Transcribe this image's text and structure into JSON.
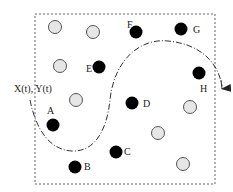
{
  "diagram": {
    "frame": {
      "x": 35,
      "y": 14,
      "width": 180,
      "height": 170
    },
    "trajectory_label": "X(t), Y(t)",
    "filled_nodes": [
      {
        "id": "A",
        "label": "A",
        "cx": 53,
        "cy": 125,
        "lx": 47,
        "ly": 106
      },
      {
        "id": "B",
        "label": "B",
        "cx": 75,
        "cy": 167,
        "lx": 84,
        "ly": 162
      },
      {
        "id": "C",
        "label": "C",
        "cx": 116,
        "cy": 152,
        "lx": 124,
        "ly": 147
      },
      {
        "id": "D",
        "label": "D",
        "cx": 132,
        "cy": 103,
        "lx": 143,
        "ly": 99
      },
      {
        "id": "E",
        "label": "E",
        "cx": 99,
        "cy": 67,
        "lx": 86,
        "ly": 64
      },
      {
        "id": "F",
        "label": "F",
        "cx": 136,
        "cy": 32,
        "lx": 127,
        "ly": 20
      },
      {
        "id": "G",
        "label": "G",
        "cx": 181,
        "cy": 29,
        "lx": 193,
        "ly": 25
      },
      {
        "id": "H",
        "label": "H",
        "cx": 199,
        "cy": 73,
        "lx": 200,
        "ly": 84
      }
    ],
    "open_nodes": [
      {
        "cx": 55,
        "cy": 27
      },
      {
        "cx": 93,
        "cy": 32
      },
      {
        "cx": 60,
        "cy": 66
      },
      {
        "cx": 76,
        "cy": 100
      },
      {
        "cx": 190,
        "cy": 107
      },
      {
        "cx": 158,
        "cy": 133
      },
      {
        "cx": 183,
        "cy": 164
      }
    ],
    "colors": {
      "filled": "#000000",
      "open_fill": "#e6e6e6",
      "open_stroke": "#555555",
      "frame": "#666666",
      "curve": "#333333"
    }
  }
}
